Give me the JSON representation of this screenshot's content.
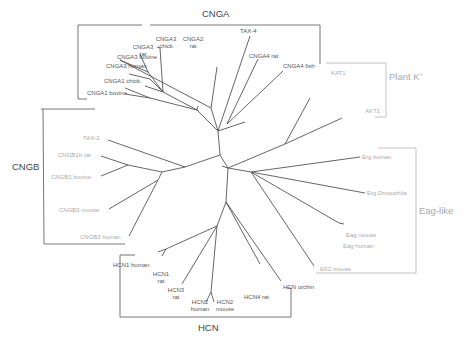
{
  "groups": {
    "cnga": "CNGA",
    "cngb": "CNGB",
    "hcn": "HCN",
    "plant_k": "Plant K",
    "plant_k_sup": "+",
    "eag_like": "Eag-like"
  },
  "leaves": {
    "cnga3_bovine": "CNGA3 bovine",
    "cnga3_human": "CNGA3 human",
    "cnga3_rat_1": "CNGA3",
    "cnga3_rat_2": "rat",
    "cnga3_chick_1": "CNGA3",
    "cnga3_chick_2": "chick",
    "cnga2_rat_1": "CNGA2",
    "cnga2_rat_2": "rat",
    "tax4": "TAX-4",
    "cnga4_rat": "CNGA4 rat",
    "cnga4_fish": "CNGA4 fish",
    "cnga1_chick": "CNGA1 chick",
    "cnga1_bovine": "CNGA1 bovine",
    "tax2": "TAX-2",
    "cngb1b_rat": "CNGB1b rat",
    "cngb1_bovine": "CNGB1 bovine",
    "cngb3_mouse": "CNGB3 mouse",
    "cngb3_human": "CNGB3 human",
    "kat1": "KAT1",
    "akt1": "AKT1",
    "erg_human": "Erg human",
    "erg_drosophila": "Erg Drosophila",
    "eag_mouse": "Eag mouse",
    "eag_human": "Eag human",
    "ekz_mouse": "EK2 mouse",
    "hcn1_human": "HCN1 human",
    "hcn1_rat_1": "HCN1",
    "hcn1_rat_2": "rat",
    "hcn3_rat_1": "HCN3",
    "hcn3_rat_2": "rat",
    "hcn2_human_1": "HCN2",
    "hcn2_human_2": "human",
    "hcn2_mouse_1": "HCN2",
    "hcn2_mouse_2": "mouse",
    "hcn4_rat": "HCN4 rat",
    "hcn_urchin": "HCN urchin"
  },
  "colors": {
    "branch": "#555555",
    "bracket_dark": "#666666",
    "bracket_light": "#bbbbbb",
    "label_dark": "#555555",
    "label_light": "#aaaaaa"
  }
}
